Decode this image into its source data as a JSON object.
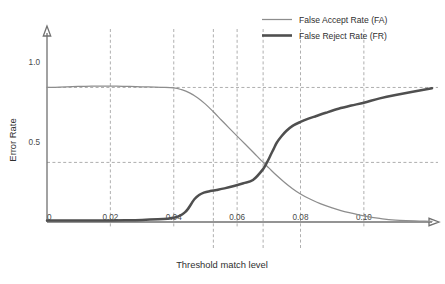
{
  "chart_data": {
    "type": "line",
    "title": "",
    "xlabel": "Threshold match level",
    "ylabel": "Error Rate",
    "xlim": [
      0,
      0.1215
    ],
    "ylim": [
      0,
      1.18
    ],
    "grid": true,
    "legend_position": "top-right",
    "x_ticks": [
      "0",
      "0.02",
      "0.04",
      "0.06",
      "0.08",
      "0.10"
    ],
    "x_tick_values": [
      0,
      0.02,
      0.04,
      0.06,
      0.08,
      0.1
    ],
    "y_ticks": [
      "1.0",
      "0.5"
    ],
    "y_tick_values": [
      1.0,
      0.5
    ],
    "gridlines_horizontal": [
      0.84,
      0.372
    ],
    "gridlines_vertical": [
      0.02,
      0.04,
      0.0525,
      0.06,
      0.0682,
      0.08,
      0.1
    ],
    "annotations": [],
    "series": [
      {
        "name": "False Accept Rate (FA)",
        "color": "#8d8d8d",
        "width": "thin",
        "x": [
          0.0,
          0.004,
          0.008,
          0.012,
          0.016,
          0.02,
          0.024,
          0.028,
          0.032,
          0.036,
          0.04,
          0.0425,
          0.045,
          0.0475,
          0.05,
          0.0525,
          0.055,
          0.0575,
          0.06,
          0.0625,
          0.065,
          0.0682,
          0.07,
          0.0725,
          0.075,
          0.0775,
          0.08,
          0.0825,
          0.085,
          0.0875,
          0.09,
          0.0925,
          0.095,
          0.1,
          0.105,
          0.11,
          0.1215
        ],
        "y": [
          0.84,
          0.842,
          0.845,
          0.847,
          0.848,
          0.848,
          0.847,
          0.845,
          0.843,
          0.841,
          0.838,
          0.826,
          0.806,
          0.776,
          0.736,
          0.688,
          0.637,
          0.586,
          0.536,
          0.487,
          0.437,
          0.372,
          0.338,
          0.29,
          0.247,
          0.208,
          0.175,
          0.148,
          0.125,
          0.105,
          0.088,
          0.073,
          0.06,
          0.038,
          0.022,
          0.012,
          0.004
        ]
      },
      {
        "name": "False Reject Rate (FR)",
        "color": "#4f4f4f",
        "width": "thick",
        "x": [
          0.0,
          0.005,
          0.01,
          0.015,
          0.02,
          0.025,
          0.03,
          0.035,
          0.038,
          0.04,
          0.042,
          0.0435,
          0.0445,
          0.0455,
          0.0465,
          0.048,
          0.0495,
          0.0515,
          0.0535,
          0.056,
          0.059,
          0.062,
          0.065,
          0.0682,
          0.0695,
          0.0705,
          0.0715,
          0.0725,
          0.074,
          0.0755,
          0.0775,
          0.08,
          0.0825,
          0.085,
          0.088,
          0.092,
          0.096,
          0.1,
          0.105,
          0.11,
          0.1215
        ],
        "y": [
          0.01,
          0.009,
          0.009,
          0.009,
          0.01,
          0.011,
          0.013,
          0.017,
          0.021,
          0.026,
          0.04,
          0.06,
          0.082,
          0.112,
          0.142,
          0.168,
          0.183,
          0.193,
          0.2,
          0.21,
          0.225,
          0.242,
          0.262,
          0.33,
          0.375,
          0.415,
          0.455,
          0.495,
          0.535,
          0.568,
          0.6,
          0.625,
          0.645,
          0.662,
          0.682,
          0.707,
          0.727,
          0.745,
          0.772,
          0.793,
          0.835
        ]
      }
    ]
  },
  "axes": {
    "y_title": "Error Rate",
    "x_title": "Threshold match level"
  },
  "legend": {
    "items": [
      {
        "label": "False Accept Rate (FA)"
      },
      {
        "label": "False Reject Rate (FR)"
      }
    ]
  }
}
